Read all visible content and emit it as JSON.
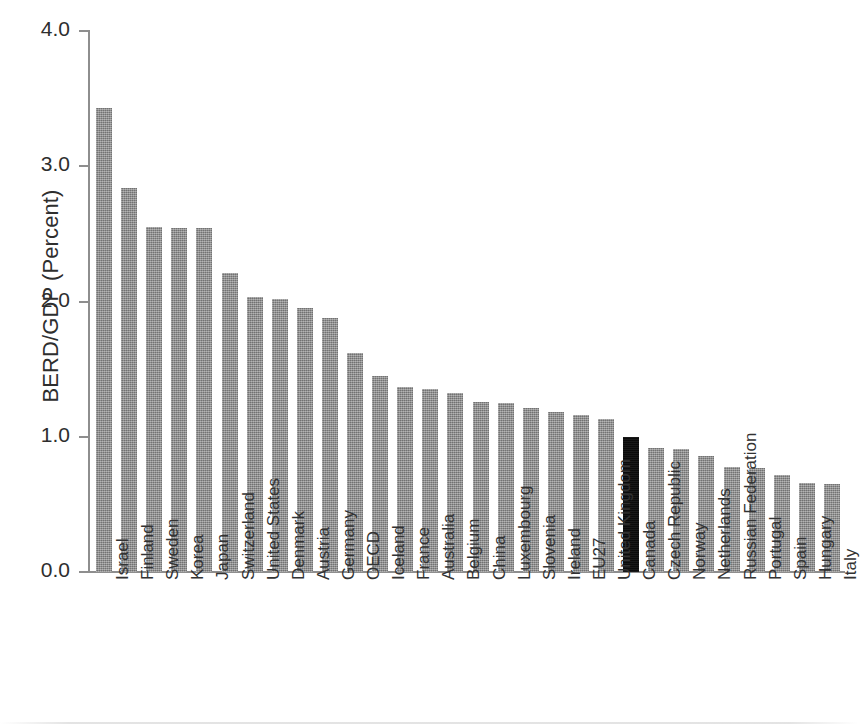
{
  "chart_data": {
    "type": "bar",
    "title": "",
    "xlabel": "",
    "ylabel": "BERD/GDP (Percent)",
    "ylim": [
      0.0,
      4.0
    ],
    "ytick_labels": [
      "0.0",
      "1.0",
      "2.0",
      "3.0",
      "4.0"
    ],
    "ytick_values": [
      0.0,
      1.0,
      2.0,
      3.0,
      4.0
    ],
    "grid": false,
    "legend": "none",
    "highlight_category": "Canada",
    "highlight_color": "#0d0d0d",
    "bar_color": "#8a8a8a",
    "categories": [
      "Israel",
      "Finland",
      "Sweden",
      "Korea",
      "Japan",
      "Switzerland",
      "United States",
      "Denmark",
      "Austria",
      "Germany",
      "OECD",
      "Iceland",
      "France",
      "Australia",
      "Belgium",
      "China",
      "Luxembourg",
      "Slovenia",
      "Ireland",
      "EU27",
      "United Kingdom",
      "Canada",
      "Czech Republic",
      "Norway",
      "Netherlands",
      "Russian Federation",
      "Portugal",
      "Spain",
      "Hungary",
      "Italy"
    ],
    "values": [
      3.43,
      2.84,
      2.55,
      2.54,
      2.54,
      2.21,
      2.03,
      2.02,
      1.95,
      1.88,
      1.62,
      1.45,
      1.37,
      1.35,
      1.32,
      1.26,
      1.25,
      1.21,
      1.18,
      1.16,
      1.13,
      1.0,
      0.92,
      0.91,
      0.86,
      0.78,
      0.77,
      0.72,
      0.66,
      0.65
    ]
  }
}
